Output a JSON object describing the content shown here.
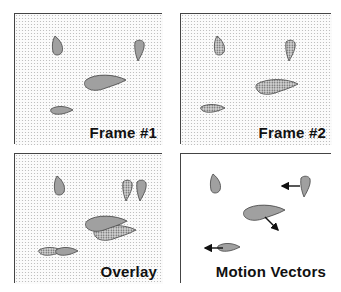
{
  "panels": [
    {
      "id": "frame1",
      "label": "Frame #1",
      "background": "dotted",
      "object_fill": "solid-gray"
    },
    {
      "id": "frame2",
      "label": "Frame #2",
      "background": "dotted",
      "object_fill": "dotted-dark"
    },
    {
      "id": "overlay",
      "label": "Overlay",
      "background": "dotted",
      "object_fill": "both"
    },
    {
      "id": "motion",
      "label": "Motion Vectors",
      "background": "white",
      "object_fill": "solid-gray"
    }
  ],
  "colors": {
    "object_gray": "#a0a0a0",
    "outline": "#444444",
    "dots": "#b5b5b5",
    "dark_dots": "#555555"
  }
}
